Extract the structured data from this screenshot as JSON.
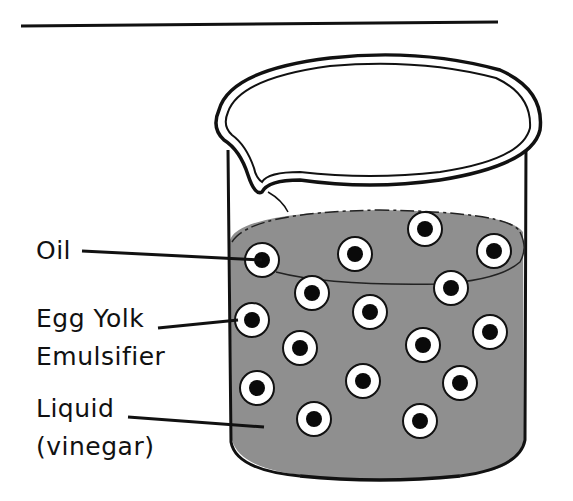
{
  "diagram": {
    "colors": {
      "liquid": "#8f8f8f",
      "outline": "#111111",
      "droplet_ring": "#ffffff",
      "droplet_core": "#0a0a0a",
      "background": "#ffffff"
    },
    "labels": [
      {
        "id": "oil",
        "lines": [
          "Oil"
        ]
      },
      {
        "id": "emulsifier",
        "lines": [
          "Egg Yolk",
          "Emulsifier"
        ]
      },
      {
        "id": "liquid",
        "lines": [
          "Liquid",
          "(vinegar)"
        ]
      }
    ],
    "droplet_count": 16
  }
}
